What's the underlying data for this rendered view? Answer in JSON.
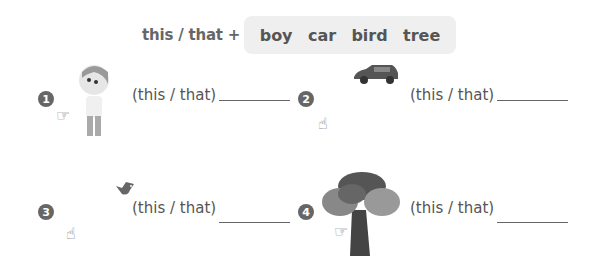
{
  "header": {
    "label": "this / that +",
    "words": [
      "boy",
      "car",
      "bird",
      "tree"
    ]
  },
  "items": [
    {
      "number": "1",
      "image": "boy-illustration",
      "prompt": "(this / that)",
      "answer": "",
      "pointer": "pointing-hand-near"
    },
    {
      "number": "2",
      "image": "car-illustration",
      "prompt": "(this / that)",
      "answer": "",
      "pointer": "pointing-hand-far"
    },
    {
      "number": "3",
      "image": "bird-illustration",
      "prompt": "(this / that)",
      "answer": "",
      "pointer": "pointing-hand-far"
    },
    {
      "number": "4",
      "image": "tree-illustration",
      "prompt": "(this / that)",
      "answer": "",
      "pointer": "pointing-hand-near"
    }
  ],
  "icons": {
    "hand_near": "☞",
    "hand_far": "☝"
  }
}
